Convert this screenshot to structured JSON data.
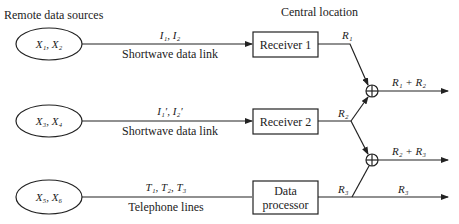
{
  "diagram": {
    "section_labels": {
      "remote": "Remote data sources",
      "central": "Central location"
    },
    "sources": [
      {
        "label": "X₁, X₂",
        "link_top": "I₁, I₂",
        "link_bottom": "Shortwave data link"
      },
      {
        "label": "X₃, X₄",
        "link_top": "I₁′, I₂′",
        "link_bottom": "Shortwave data link"
      },
      {
        "label": "X₅, X₆",
        "link_top": "T₁, T₂, T₃",
        "link_bottom": "Telephone lines"
      }
    ],
    "blocks": [
      {
        "label": "Receiver 1",
        "output": "R₁"
      },
      {
        "label": "Receiver 2",
        "output": "R₂"
      },
      {
        "label_line1": "Data",
        "label_line2": "processor",
        "output": "R₃"
      }
    ],
    "junctions": [
      {
        "symbol": "sum",
        "output": "R₁ + R₂"
      },
      {
        "symbol": "sum",
        "output": "R₂ + R₃"
      }
    ],
    "final_output": "R₃"
  }
}
